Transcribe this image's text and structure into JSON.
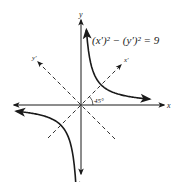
{
  "diagram": {
    "type": "rotated-axes-hyperbola",
    "equation": "(x′)² − (y′)² = 9",
    "axis_labels": {
      "x": "x",
      "y": "y",
      "x_prime": "x′",
      "y_prime": "y′"
    },
    "rotation_angle_label": "45°",
    "rotation_angle_deg": 45,
    "curve": {
      "description": "hyperbola xy = 4.5 (branches in quadrants I and III)",
      "xy_constant": 4.5
    },
    "colors": {
      "ink": "#1a1a1a",
      "background": "#ffffff"
    }
  }
}
